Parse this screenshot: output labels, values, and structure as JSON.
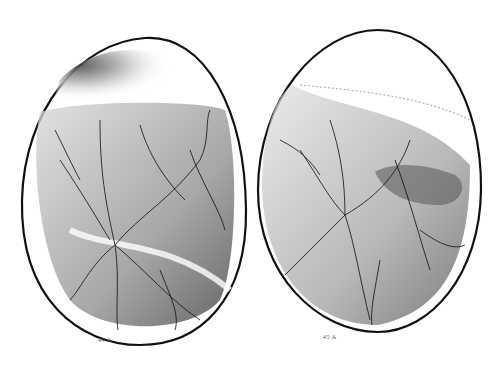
{
  "figure": {
    "type": "scientific illustration",
    "colors": {
      "ink": "#111111",
      "paper": "#ffffff",
      "shade": "#6a6a6a"
    },
    "panels": [
      {
        "label": "44 A",
        "position": "left"
      },
      {
        "label": "45 A",
        "position": "right"
      }
    ]
  }
}
